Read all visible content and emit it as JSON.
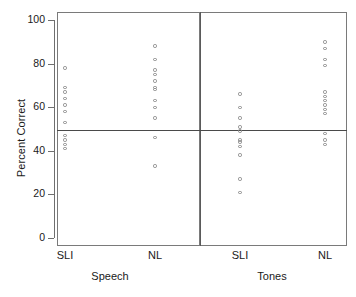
{
  "chart_data": {
    "type": "scatter",
    "title": "",
    "xlabel": "",
    "ylabel": "Percent Correct",
    "ylim": [
      0,
      100
    ],
    "yticks": [
      0,
      20,
      40,
      60,
      80,
      100
    ],
    "grid": false,
    "legend": null,
    "panels": [
      {
        "name": "Speech",
        "groups": [
          {
            "name": "SLI",
            "values": [
              78,
              69,
              67,
              64,
              61,
              58,
              53,
              47,
              45,
              43,
              41
            ]
          },
          {
            "name": "NL",
            "values": [
              88,
              82,
              77,
              75,
              72,
              69,
              68,
              63,
              60,
              55,
              46,
              33
            ]
          }
        ]
      },
      {
        "name": "Tones",
        "groups": [
          {
            "name": "SLI",
            "values": [
              66,
              60,
              55,
              51,
              49,
              45,
              44,
              42,
              38,
              27,
              21
            ]
          },
          {
            "name": "NL",
            "values": [
              90,
              87,
              82,
              79,
              67,
              65,
              63,
              61,
              59,
              57,
              48,
              45,
              43
            ]
          }
        ]
      }
    ],
    "reference_line": {
      "value": 49.5,
      "orientation": "horizontal"
    }
  },
  "axis": {
    "y_title": "Percent Correct",
    "tick_labels": [
      "100",
      "80",
      "60",
      "40",
      "20",
      "0"
    ]
  },
  "x_labels": {
    "speech_sli": "SLI",
    "speech_nl": "NL",
    "tones_sli": "SLI",
    "tones_nl": "NL",
    "panel_speech": "Speech",
    "panel_tones": "Tones"
  },
  "colors": {
    "axis": "#6f6f6f",
    "frame": "#7a7a7a",
    "point": "#8a8a8a",
    "reference": "#4a4a4a",
    "text": "#1a1a1a"
  }
}
